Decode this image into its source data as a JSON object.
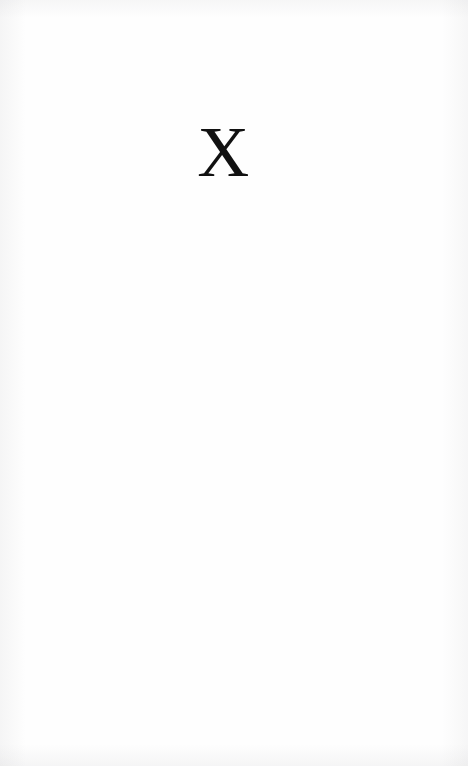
{
  "document": {
    "kind": "scanned-book-page",
    "page_type": "part-divider",
    "background_color": "#fefefe",
    "ink_color": "#111111",
    "width": 468,
    "height": 766
  },
  "content": {
    "numeral": "X",
    "numeral_meaning": "10",
    "numeral_style": "serif-roman-numeral"
  },
  "body": {
    "text": ""
  }
}
